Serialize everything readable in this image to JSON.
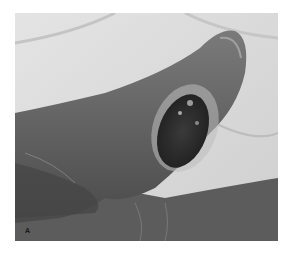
{
  "figure": {
    "panel_label": "A",
    "colors": {
      "background": "#ffffff",
      "sheet": "#d8d8d8",
      "skin": "#6e6e6e",
      "skin_dark": "#3a3a3a",
      "lesion": "#2a2a2a",
      "lesion_rim": "#bdbdbd"
    }
  }
}
